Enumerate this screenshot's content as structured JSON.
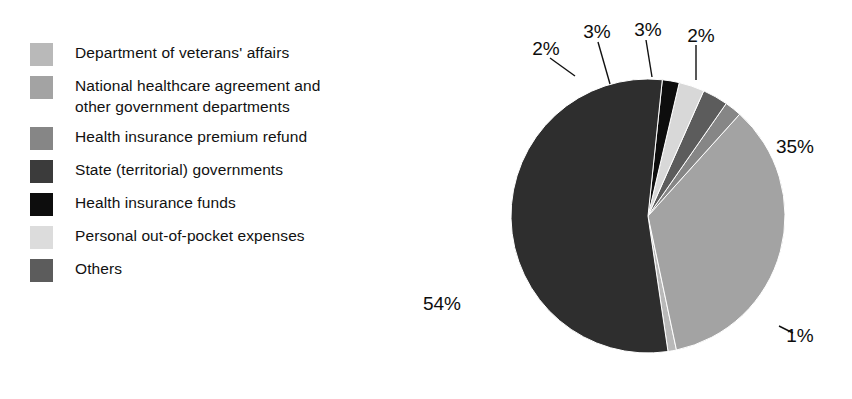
{
  "chart_data": {
    "type": "pie",
    "title": "",
    "subtitle": "",
    "xlabel": "",
    "ylabel": "",
    "legend_position": "left",
    "grid": false,
    "unit": "%",
    "categories": [
      "Department of veterans' affairs",
      "National healthcare agreement and\nother government departments",
      "Health insurance premium refund",
      "State (territorial) governments",
      "Health insurance funds",
      "Personal out-of-pocket expenses",
      "Others"
    ],
    "values": [
      1,
      35,
      2,
      3,
      3,
      2,
      54
    ],
    "slices": [
      {
        "name": "Department of veterans' affairs",
        "value": 1,
        "label": "1%",
        "color": "#b9b9b9",
        "start_angle": 78,
        "end_angle": 81.6,
        "label_x": 800,
        "label_y": 337,
        "leader": {
          "x1": 779,
          "y1": 326,
          "x2": 793,
          "y2": 333
        }
      },
      {
        "name": "National healthcare agreement and other government departments",
        "value": 35,
        "label": "35%",
        "color": "#a3a3a3",
        "start_angle": -48,
        "end_angle": 78,
        "label_x": 795,
        "label_y": 148,
        "leader": null
      },
      {
        "name": "Health insurance premium refund",
        "value": 2,
        "label": "2%",
        "color": "#868686",
        "start_angle": -55.2,
        "end_angle": -48,
        "label_x": 701,
        "label_y": 37,
        "leader": {
          "x1": 696,
          "y1": 45,
          "x2": 696,
          "y2": 80
        }
      },
      {
        "name": "State (territorial) governments",
        "value": 3,
        "label": "3%",
        "color": "#5c5c5c",
        "start_angle": -66,
        "end_angle": -55.2,
        "label_x": 648,
        "label_y": 31,
        "leader": {
          "x1": 646,
          "y1": 40,
          "x2": 652,
          "y2": 77
        }
      },
      {
        "name": "Health insurance funds",
        "value": 3,
        "label": "3%",
        "color": "#d8d8d8",
        "start_angle": -76.8,
        "end_angle": -66,
        "label_x": 597,
        "label_y": 33,
        "leader": {
          "x1": 598,
          "y1": 42,
          "x2": 610,
          "y2": 84
        }
      },
      {
        "name": "Personal out-of-pocket expenses",
        "value": 2,
        "label": "2%",
        "color": "#0d0d0d",
        "start_angle": -84,
        "end_angle": -76.8,
        "label_x": 546,
        "label_y": 50,
        "leader": {
          "x1": 550,
          "y1": 58,
          "x2": 575,
          "y2": 76
        }
      },
      {
        "name": "Others",
        "value": 54,
        "label": "54%",
        "color": "#2e2e2e",
        "start_angle": 81.6,
        "end_angle": 276,
        "label_x": 442,
        "label_y": 305,
        "leader": null
      }
    ],
    "geometry": {
      "center_x": 648,
      "center_y": 216,
      "radius": 137
    }
  },
  "legend": {
    "items": [
      {
        "label": "Department of veterans' affairs",
        "color": "#b9b9b9"
      },
      {
        "label": "National healthcare agreement and\nother government departments",
        "color": "#a3a3a3"
      },
      {
        "label": "Health insurance premium refund",
        "color": "#868686"
      },
      {
        "label": "State (territorial) governments",
        "color": "#3b3b3b"
      },
      {
        "label": "Health insurance funds",
        "color": "#0d0d0d"
      },
      {
        "label": "Personal out-of-pocket expenses",
        "color": "#dcdcdc"
      },
      {
        "label": "Others",
        "color": "#5c5c5c"
      }
    ]
  }
}
